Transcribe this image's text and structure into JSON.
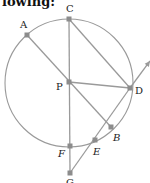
{
  "header": {
    "text": "lowing:"
  },
  "diagram": {
    "stroke_color": "#9a9a9a",
    "point_color": "#8c8c8c",
    "circle": {
      "center": "P",
      "cx": 69,
      "cy": 83,
      "r": 64
    },
    "points": [
      {
        "name": "A",
        "x": 27,
        "y": 35,
        "label_x": 20,
        "label_y": 28
      },
      {
        "name": "C",
        "x": 69,
        "y": 19,
        "label_x": 66,
        "label_y": 12
      },
      {
        "name": "P",
        "x": 69,
        "y": 82,
        "label_x": 56,
        "label_y": 90
      },
      {
        "name": "D",
        "x": 130,
        "y": 88,
        "label_x": 135,
        "label_y": 94
      },
      {
        "name": "B",
        "x": 111,
        "y": 127,
        "label_x": 113,
        "label_y": 141
      },
      {
        "name": "E",
        "x": 95,
        "y": 140,
        "label_x": 93,
        "label_y": 155
      },
      {
        "name": "F",
        "x": 70,
        "y": 146,
        "label_x": 58,
        "label_y": 157
      },
      {
        "name": "G",
        "x": 70,
        "y": 173,
        "label_x": 66,
        "label_y": 186
      }
    ],
    "segments": [
      {
        "from": "A",
        "to": "B"
      },
      {
        "from": "C",
        "to": "G"
      },
      {
        "from": "C",
        "to": "D"
      },
      {
        "from": "P",
        "to": "D"
      },
      {
        "from": "G",
        "to": "D"
      }
    ],
    "ray": {
      "from": "D",
      "to_x": 150,
      "to_y": 61
    }
  }
}
